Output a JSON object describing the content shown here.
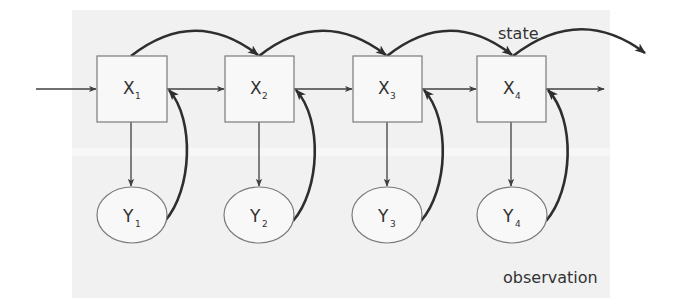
{
  "diagram": {
    "type": "hidden-markov-model",
    "labels": {
      "state": "state",
      "observation": "observation"
    },
    "state_nodes": [
      {
        "id": "X1",
        "base": "X",
        "sub": "1"
      },
      {
        "id": "X2",
        "base": "X",
        "sub": "2"
      },
      {
        "id": "X3",
        "base": "X",
        "sub": "3"
      },
      {
        "id": "X4",
        "base": "X",
        "sub": "4"
      }
    ],
    "observation_nodes": [
      {
        "id": "Y1",
        "base": "Y",
        "sub": "1"
      },
      {
        "id": "Y2",
        "base": "Y",
        "sub": "2"
      },
      {
        "id": "Y3",
        "base": "Y",
        "sub": "3"
      },
      {
        "id": "Y4",
        "base": "Y",
        "sub": "4"
      }
    ],
    "edges": [
      {
        "from": "input",
        "to": "X1",
        "style": "thin"
      },
      {
        "from": "X1",
        "to": "X2",
        "style": "thin"
      },
      {
        "from": "X2",
        "to": "X3",
        "style": "thin"
      },
      {
        "from": "X3",
        "to": "X4",
        "style": "thin"
      },
      {
        "from": "X4",
        "to": "output",
        "style": "thin"
      },
      {
        "from": "X1",
        "to": "X2",
        "style": "thick-arc-top"
      },
      {
        "from": "X2",
        "to": "X3",
        "style": "thick-arc-top"
      },
      {
        "from": "X3",
        "to": "X4",
        "style": "thick-arc-top"
      },
      {
        "from": "X4",
        "to": "next",
        "style": "thick-arc-top"
      },
      {
        "from": "X1",
        "to": "Y1",
        "style": "thin"
      },
      {
        "from": "X2",
        "to": "Y2",
        "style": "thin"
      },
      {
        "from": "X3",
        "to": "Y3",
        "style": "thin"
      },
      {
        "from": "X4",
        "to": "Y4",
        "style": "thin"
      },
      {
        "from": "Y1",
        "to": "X1",
        "style": "thick-curve"
      },
      {
        "from": "Y2",
        "to": "X2",
        "style": "thick-curve"
      },
      {
        "from": "Y3",
        "to": "X3",
        "style": "thick-curve"
      },
      {
        "from": "Y4",
        "to": "X4",
        "style": "thick-curve"
      }
    ]
  }
}
